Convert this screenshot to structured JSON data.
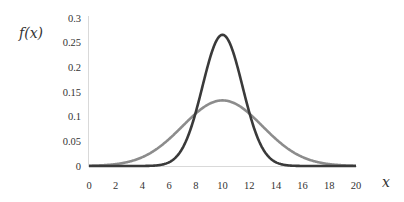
{
  "chart_data": {
    "type": "line",
    "title": "",
    "xlabel": "x",
    "ylabel": "f(x)",
    "xlim": [
      0,
      20
    ],
    "ylim": [
      0,
      0.3
    ],
    "grid": false,
    "legend": null,
    "x_ticks": [
      "0",
      "2",
      "4",
      "6",
      "8",
      "10",
      "12",
      "14",
      "16",
      "18",
      "20"
    ],
    "y_ticks": [
      "0",
      "0.05",
      "0.1",
      "0.15",
      "0.2",
      "0.25",
      "0.3"
    ],
    "series": [
      {
        "name": "Normal (mean 10, sd 1.5)",
        "color": "#3a3a3a",
        "mean": 10,
        "sd": 1.5,
        "peak": 0.266
      },
      {
        "name": "Normal (mean 10, sd 3)",
        "color": "#8c8c8c",
        "mean": 10,
        "sd": 3,
        "peak": 0.133
      }
    ]
  }
}
